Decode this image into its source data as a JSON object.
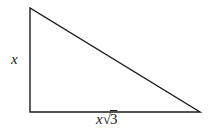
{
  "figure": {
    "type": "right-triangle",
    "colors": {
      "stroke": "#1c1c1c",
      "background": "#ffffff"
    },
    "labels": {
      "left_side": "x",
      "bottom_side": "x√3",
      "bottom_coefficient": "x",
      "bottom_radical_sign": "√",
      "bottom_radicand": "3"
    }
  }
}
